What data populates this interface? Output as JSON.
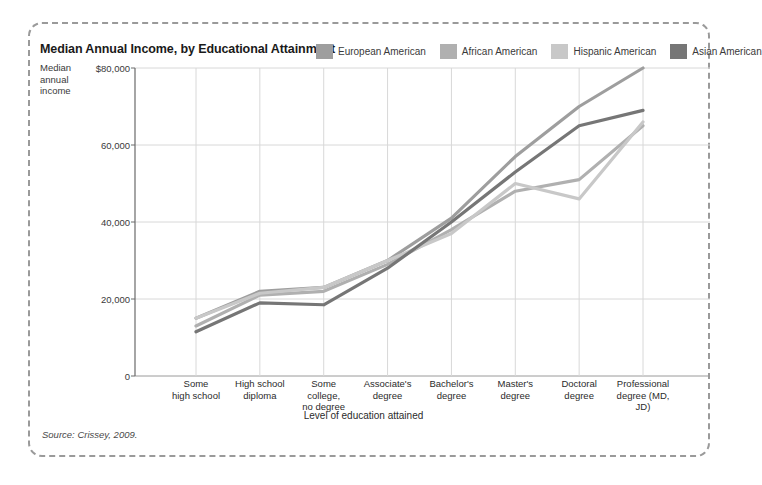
{
  "title": "Median Annual Income, by Educational Attainment",
  "source_note": "Source: Crissey, 2009.",
  "axes": {
    "y_title_lines": [
      "Median",
      "annual",
      "income"
    ],
    "x_title": "Level of education attained"
  },
  "legend": {
    "items": [
      {
        "label": "European American",
        "color": "#9e9e9e"
      },
      {
        "label": "African American",
        "color": "#b0b0b0"
      },
      {
        "label": "Hispanic American",
        "color": "#c8c8c8"
      },
      {
        "label": "Asian American",
        "color": "#767676"
      }
    ]
  },
  "chart_data": {
    "type": "line",
    "title": "Median Annual Income, by Educational Attainment",
    "xlabel": "Level of education attained",
    "ylabel": "Median annual income",
    "ylim": [
      0,
      80000
    ],
    "y_ticks": [
      0,
      20000,
      40000,
      60000,
      80000
    ],
    "y_tick_labels": [
      "0",
      "20,000",
      "40,000",
      "60,000",
      "$80,000"
    ],
    "grid": true,
    "legend_position": "top-right",
    "categories": [
      "Some high school",
      "High school diploma",
      "Some college, no degree",
      "Associate's degree",
      "Bachelor's degree",
      "Master's degree",
      "Doctoral degree",
      "Professional degree (MD, JD)"
    ],
    "category_label_lines": [
      [
        "Some",
        "high school"
      ],
      [
        "High school",
        "diploma"
      ],
      [
        "Some",
        "college,",
        "no degree"
      ],
      [
        "Associate's",
        "degree"
      ],
      [
        "Bachelor's",
        "degree"
      ],
      [
        "Master's",
        "degree"
      ],
      [
        "Doctoral",
        "degree"
      ],
      [
        "Professional",
        "degree (MD,",
        "JD)"
      ]
    ],
    "series": [
      {
        "name": "European American",
        "color": "#9e9e9e",
        "values": [
          15000,
          22000,
          23000,
          30000,
          41000,
          57000,
          70000,
          80000
        ]
      },
      {
        "name": "African American",
        "color": "#b0b0b0",
        "values": [
          13000,
          21000,
          22000,
          29000,
          38000,
          48000,
          51000,
          65000
        ]
      },
      {
        "name": "Hispanic American",
        "color": "#c8c8c8",
        "values": [
          15000,
          21500,
          23000,
          30000,
          37000,
          50000,
          46000,
          66000
        ]
      },
      {
        "name": "Asian American",
        "color": "#767676",
        "values": [
          11500,
          19000,
          18500,
          28000,
          40000,
          53000,
          65000,
          69000
        ]
      }
    ]
  }
}
